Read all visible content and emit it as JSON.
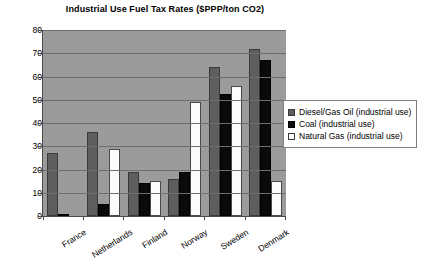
{
  "chart_data": {
    "type": "bar",
    "title": "Industrial Use Fuel Tax Rates ($PPP/ton CO2)",
    "xlabel": "",
    "ylabel": "",
    "ylim": [
      0,
      80
    ],
    "ytick_step": 10,
    "yticks": [
      80,
      70,
      60,
      50,
      40,
      30,
      20,
      10,
      0
    ],
    "grid": true,
    "legend_position": "right",
    "categories": [
      "France",
      "Netherlands",
      "Finland",
      "Norway",
      "Sweden",
      "Denmark"
    ],
    "series": [
      {
        "name": "Diesel/Gas Oil (industrial use)",
        "color": "#5e5e5e",
        "values": [
          27,
          36,
          19,
          16,
          64,
          72
        ]
      },
      {
        "name": "Coal (industrial use)",
        "color": "#0a0a0a",
        "values": [
          0.5,
          5,
          14,
          19,
          52.5,
          67
        ]
      },
      {
        "name": "Natural Gas (industrial use)",
        "color": "#ffffff",
        "values": [
          0,
          29,
          15,
          49,
          56,
          15
        ]
      }
    ]
  },
  "colors": {
    "plot_background": "#9b9b9b",
    "gridline": "#6e6e6e",
    "axis": "#4a4a4a",
    "page_background": "#ffffff",
    "text": "#000000"
  }
}
